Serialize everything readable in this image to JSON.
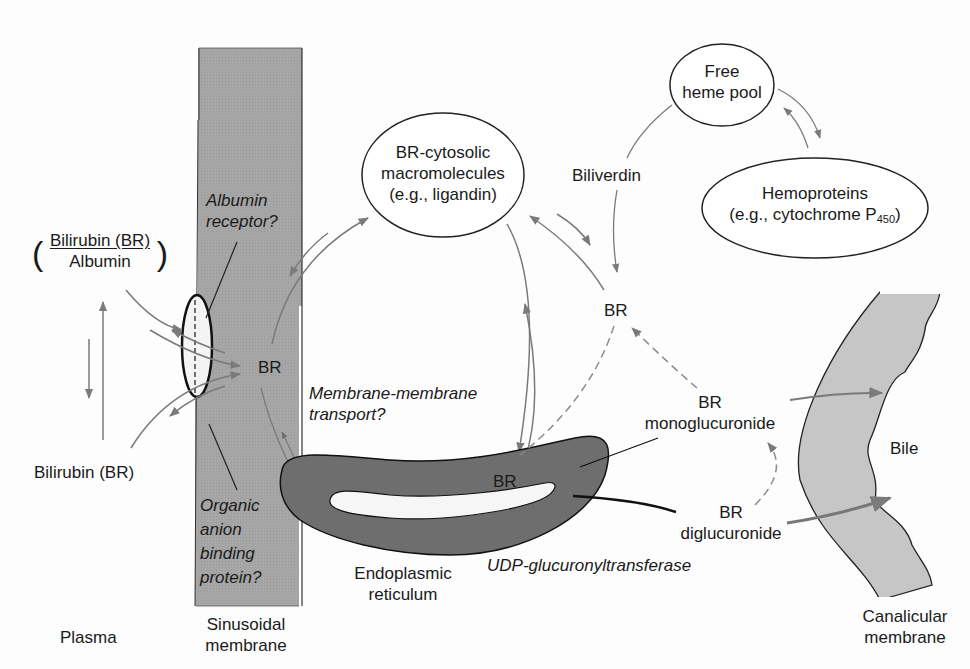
{
  "diagram": {
    "type": "bilirubin hepatic transport and conjugation pathway",
    "colors": {
      "membrane_fill": "#a8a8a8",
      "er_fill": "#6f6f6f",
      "canalicular_fill": "#c4c4c4",
      "arrow": "#7a7a7a",
      "ink": "#1a1a1a"
    },
    "plasma": {
      "complex_numerator": "Bilirubin (BR)",
      "complex_denominator": "Albumin",
      "free_bilirubin": "Bilirubin (BR)",
      "region_label": "Plasma"
    },
    "sinusoidal": {
      "albumin_receptor_line1": "Albumin",
      "albumin_receptor_line2": "receptor?",
      "br": "BR",
      "organic_line1": "Organic",
      "organic_line2": "anion",
      "organic_line3": "binding",
      "organic_line4": "protein?",
      "label_line1": "Sinusoidal",
      "label_line2": "membrane"
    },
    "cytosol": {
      "cytosolic_line1": "BR-cytosolic",
      "cytosolic_line2": "macromolecules",
      "cytosolic_line3": "(e.g., ligandin)",
      "transport_line1": "Membrane-membrane",
      "transport_line2": "transport?",
      "br_center": "BR",
      "biliverdin": "Biliverdin",
      "heme_line1": "Free",
      "heme_line2": "heme pool",
      "hemo_line1": "Hemoproteins",
      "hemo_line2": "(e.g., cytochrome P",
      "hemo_sub": "450",
      "hemo_close": ")"
    },
    "er": {
      "br": "BR",
      "label_line1": "Endoplasmic",
      "label_line2": "reticulum",
      "enzyme": "UDP-glucuronyltransferase"
    },
    "conjugates": {
      "mono_line1": "BR",
      "mono_line2": "monoglucuronide",
      "di_line1": "BR",
      "di_line2": "diglucuronide"
    },
    "canalicular": {
      "bile": "Bile",
      "label_line1": "Canalicular",
      "label_line2": "membrane"
    }
  }
}
